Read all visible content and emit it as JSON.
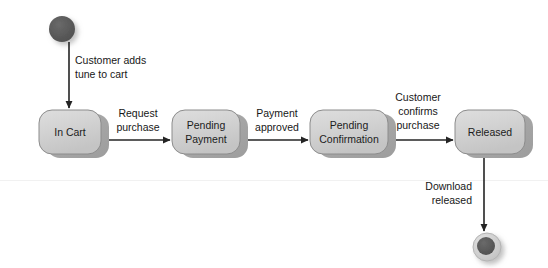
{
  "diagram": {
    "type": "uml-state-machine",
    "colors": {
      "state_fill_light": "#d4d4d4",
      "state_fill_dark": "#a8a8a8",
      "state_border": "#8c8c8c",
      "node_dark": "#585858",
      "node_ring": "#d0d0d0",
      "edge": "#242424",
      "text": "#171717",
      "background": "#ffffff"
    },
    "start_node": {
      "name": "initial-state",
      "shape": "filled-circle",
      "cx": 62,
      "cy": 29,
      "r": 13
    },
    "end_node": {
      "name": "final-state",
      "shape": "bullseye",
      "cx": 487,
      "cy": 247,
      "outer_r": 14,
      "inner_r": 9
    },
    "states": [
      {
        "id": "in-cart",
        "lines": [
          "In Cart"
        ],
        "x": 39,
        "y": 110,
        "width": 62,
        "height": 44
      },
      {
        "id": "pending-payment",
        "lines": [
          "Pending",
          "Payment"
        ],
        "x": 172,
        "y": 110,
        "width": 68,
        "height": 44
      },
      {
        "id": "pending-confirmation",
        "lines": [
          "Pending",
          "Confirmation"
        ],
        "x": 310,
        "y": 110,
        "width": 78,
        "height": 44
      },
      {
        "id": "released",
        "lines": [
          "Released"
        ],
        "x": 455,
        "y": 110,
        "width": 70,
        "height": 44
      }
    ],
    "transitions": [
      {
        "id": "start-to-in-cart",
        "from": "initial-state",
        "to": "in-cart",
        "orientation": "vertical",
        "lines": [
          "Customer adds",
          "tune to cart"
        ],
        "label_x": 75,
        "label_y": 64,
        "label_align": "start"
      },
      {
        "id": "in-cart-to-pending-payment",
        "from": "in-cart",
        "to": "pending-payment",
        "orientation": "horizontal",
        "lines": [
          "Request",
          "purchase"
        ],
        "label_x": 138,
        "label_y": 117,
        "label_align": "center"
      },
      {
        "id": "pending-payment-to-pending-confirmation",
        "from": "pending-payment",
        "to": "pending-confirmation",
        "orientation": "horizontal",
        "lines": [
          "Payment",
          "approved"
        ],
        "label_x": 277,
        "label_y": 117,
        "label_align": "center"
      },
      {
        "id": "pending-confirmation-to-released",
        "from": "pending-confirmation",
        "to": "released",
        "orientation": "horizontal",
        "lines": [
          "Customer",
          "confirms",
          "purchase"
        ],
        "label_x": 418,
        "label_y": 101,
        "label_align": "center"
      },
      {
        "id": "released-to-final",
        "from": "released",
        "to": "final-state",
        "orientation": "vertical",
        "lines": [
          "Download",
          "released"
        ],
        "label_x": 472,
        "label_y": 190,
        "label_align": "end"
      }
    ]
  }
}
